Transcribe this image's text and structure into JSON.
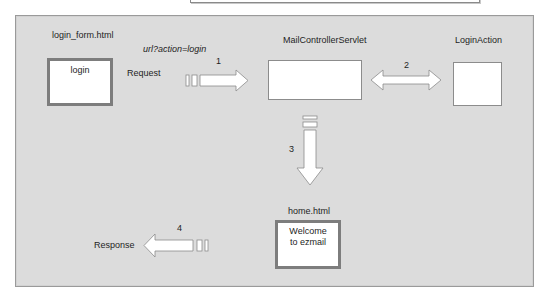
{
  "diagram": {
    "nodes": {
      "login_form": {
        "title": "login_form.html",
        "content": "login"
      },
      "controller": {
        "title": "MailControllerServlet",
        "content": ""
      },
      "login_action": {
        "title": "LoginAction",
        "content": ""
      },
      "home": {
        "title": "home.html",
        "content_line1": "Welcome",
        "content_line2": "to ezmail"
      }
    },
    "labels": {
      "url": "url?action=login",
      "request": "Request",
      "response": "Response"
    },
    "steps": {
      "step1": "1",
      "step2": "2",
      "step3": "3",
      "step4": "4"
    },
    "colors": {
      "panel_bg": "#dcdcdc",
      "box_fill": "#ffffff",
      "box_border": "#7d7d7d",
      "arrow_fill": "#ffffff",
      "arrow_stroke": "#8c8c8c"
    }
  }
}
